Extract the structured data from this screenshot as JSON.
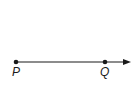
{
  "diagram": {
    "type": "ray",
    "points": [
      {
        "label": "P",
        "x": 16,
        "y": 62
      },
      {
        "label": "Q",
        "x": 105,
        "y": 62
      }
    ],
    "arrow_end": {
      "x": 131,
      "y": 62
    },
    "color": "#1a1a1a"
  }
}
